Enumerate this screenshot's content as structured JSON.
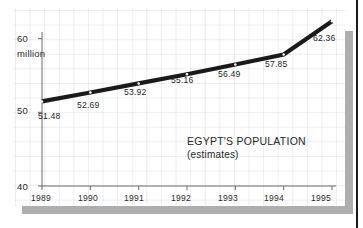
{
  "figure": {
    "accent_color": "#1a1a1a",
    "panel_color": "#ffffff",
    "shadow_color": "#aeaeae",
    "grid_color": "#969ba5"
  },
  "labels": {
    "unit": "million",
    "title_line1": "EGYPT'S POPULATION",
    "title_line2": "(estimates)"
  },
  "chart_data": {
    "type": "line",
    "title": "EGYPT'S POPULATION",
    "subtitle": "(estimates)",
    "xlabel": "",
    "ylabel": "million",
    "categories": [
      "1989",
      "1990",
      "1991",
      "1992",
      "1993",
      "1994",
      "1995"
    ],
    "values": [
      51.48,
      52.69,
      53.92,
      55.16,
      56.49,
      57.85,
      62.36
    ],
    "point_labels": [
      "51.48",
      "52.69",
      "53.92",
      "55.16",
      "56.49",
      "57.85",
      "62.36"
    ],
    "ylim": [
      40,
      62.8
    ],
    "ytick_values": [
      40,
      50,
      60
    ],
    "ytick_labels": [
      "40",
      "50",
      "60"
    ],
    "xtick_labels": [
      "1989",
      "1990",
      "1991",
      "1992",
      "1993",
      "1994",
      "1995"
    ],
    "grid": true,
    "legend": "none",
    "series": [
      {
        "name": "Egypt population (millions)",
        "values": [
          51.48,
          52.69,
          53.92,
          55.16,
          56.49,
          57.85,
          62.36
        ]
      }
    ]
  }
}
